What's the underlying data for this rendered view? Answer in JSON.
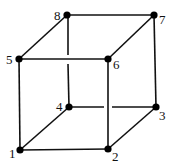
{
  "diagram": {
    "type": "cube",
    "vertices": [
      {
        "id": "1",
        "x": 20,
        "y": 150,
        "lx": 9,
        "ly": 158
      },
      {
        "id": "2",
        "x": 108,
        "y": 149,
        "lx": 113,
        "ly": 160
      },
      {
        "id": "3",
        "x": 156,
        "y": 107,
        "lx": 159,
        "ly": 119
      },
      {
        "id": "4",
        "x": 69,
        "y": 107,
        "lx": 56,
        "ly": 111
      },
      {
        "id": "5",
        "x": 19,
        "y": 59,
        "lx": 6,
        "ly": 64
      },
      {
        "id": "6",
        "x": 108,
        "y": 59,
        "lx": 113,
        "ly": 68
      },
      {
        "id": "7",
        "x": 154,
        "y": 15,
        "lx": 159,
        "ly": 23
      },
      {
        "id": "8",
        "x": 67,
        "y": 15,
        "lx": 54,
        "ly": 20
      }
    ],
    "edges": [
      [
        "1",
        "2"
      ],
      [
        "2",
        "3"
      ],
      [
        "3",
        "4"
      ],
      [
        "4",
        "1"
      ],
      [
        "5",
        "6"
      ],
      [
        "6",
        "7"
      ],
      [
        "7",
        "8"
      ],
      [
        "8",
        "5"
      ],
      [
        "1",
        "5"
      ],
      [
        "2",
        "6"
      ],
      [
        "3",
        "7"
      ],
      [
        "4",
        "8"
      ]
    ],
    "labels": {
      "v1": "1",
      "v2": "2",
      "v3": "3",
      "v4": "4",
      "v5": "5",
      "v6": "6",
      "v7": "7",
      "v8": "8"
    }
  }
}
